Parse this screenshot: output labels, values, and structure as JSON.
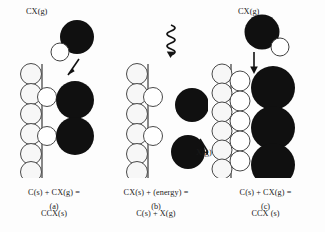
{
  "figure": {
    "type": "diagram",
    "background_color": "#fdfdfd",
    "atom_colors": {
      "carbon_black": "#101010",
      "heteroatom_white": "#ffffff",
      "outline": "#444444",
      "surface_line": "#3a3a3a"
    }
  },
  "panels": [
    {
      "id": "a",
      "letter": "(a)",
      "caption_line1": "C(s) + CX(g) =",
      "caption_line2": "CCX(s)",
      "gas_label": "CX(g)",
      "description": "Gaseous CX molecule approaching a carbon surface edge and chemisorbing",
      "arrow": "down-left-arrow",
      "free_molecule": {
        "black_circles": 1,
        "white_circles": 1
      },
      "surface": {
        "left_column_white_circles": 6,
        "inner_white_circles": 2,
        "black_circles": 2
      }
    },
    {
      "id": "b",
      "letter": "(b)",
      "caption_line1": "CX(s) + (energy) =",
      "caption_line2": "C(s) + X(g)",
      "gas_label": "X(g)",
      "description": "Energy input desorbs X atoms from the surface, releasing them as gas",
      "energy_symbol": "squiggly-down-arrow",
      "arrow": "down-right-arrow",
      "free_circles": {
        "black_circles": 2
      },
      "surface": {
        "left_column_white_circles": 6,
        "inner_white_circles": 2,
        "black_circles": 0
      }
    },
    {
      "id": "c",
      "letter": "(c)",
      "caption_line1": "C(s) + CX(g) =",
      "caption_line2": "CCX (s)",
      "gas_label": "CX(g)",
      "description": "Further CX addition grows the carbon deposit layer on the surface",
      "arrow": "down-arrow",
      "free_molecule": {
        "black_circles": 1,
        "white_circles": 1
      },
      "surface": {
        "left_column_white_circles": 6,
        "second_column_white_circles": 5,
        "black_circles": 3
      }
    }
  ]
}
